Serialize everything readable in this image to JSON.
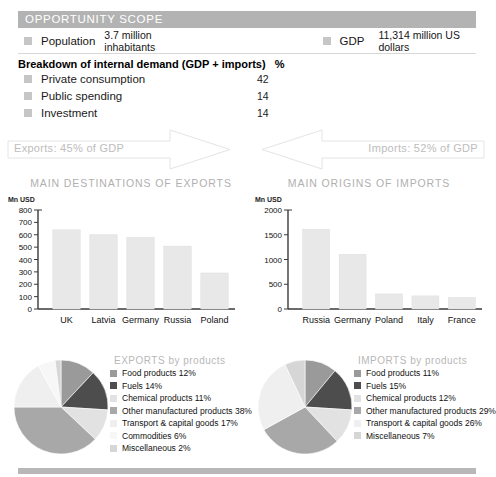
{
  "scope": {
    "header_title": "OPPORTUNITY SCOPE",
    "population_label": "Population",
    "population_value": "3.7 million inhabitants",
    "gdp_label": "GDP",
    "gdp_value": "11,314 million US dollars",
    "breakdown_title": "Breakdown of internal demand (GDP + imports)",
    "breakdown_unit": "%",
    "breakdown_rows": [
      {
        "label": "Private consumption",
        "value": "42"
      },
      {
        "label": "Public spending",
        "value": "14"
      },
      {
        "label": "Investment",
        "value": "14"
      }
    ]
  },
  "flows": {
    "exports_text": "Exports: 45% of GDP",
    "imports_text": "Imports: 52% of GDP",
    "exports_icon": "right-arrow-icon",
    "imports_icon": "left-arrow-icon"
  },
  "colors": {
    "header_gray": "#b3b3b3",
    "swatch_gray": "#c6c6c6",
    "bar_fill": "#e8e8e8",
    "axis": "#3a3a3a",
    "title_gray": "#b0b0b0",
    "slice_food": "#9a9a9a",
    "slice_fuels": "#4d4d4d",
    "slice_chemical": "#e2e2e2",
    "slice_other": "#a8a8a8",
    "slice_transport": "#efefef",
    "slice_commodities": "#f7f7f7",
    "slice_misc": "#d6d6d6"
  },
  "chart_data": [
    {
      "type": "bar",
      "name": "main-destinations-of-exports",
      "title": "MAIN DESTINATIONS OF EXPORTS",
      "ylabel": "Mn USD",
      "xlabel": "",
      "categories": [
        "UK",
        "Latvia",
        "Germany",
        "Russia",
        "Poland"
      ],
      "values": [
        640,
        600,
        578,
        508,
        291
      ],
      "ylim": [
        0,
        800
      ],
      "yticks": [
        0,
        100,
        200,
        300,
        400,
        500,
        600,
        700,
        800
      ],
      "grid": false,
      "legend": "none"
    },
    {
      "type": "bar",
      "name": "main-origins-of-imports",
      "title": "MAIN ORIGINS OF IMPORTS",
      "ylabel": "Mn USD",
      "xlabel": "",
      "categories": [
        "Russia",
        "Germany",
        "Poland",
        "Italy",
        "France"
      ],
      "values": [
        1610,
        1105,
        305,
        265,
        232
      ],
      "ylim": [
        0,
        2000
      ],
      "yticks": [
        0,
        500,
        1000,
        1500,
        2000
      ],
      "grid": false,
      "legend": "none"
    },
    {
      "type": "pie",
      "name": "exports-by-products",
      "title": "EXPORTS by products",
      "legend_position": "right",
      "labels": [
        "Food products",
        "Fuels",
        "Chemical products",
        "Other manufactured products",
        "Transport & capital goods",
        "Commodities",
        "Miscellaneous"
      ],
      "values": [
        12,
        14,
        11,
        38,
        17,
        6,
        2
      ],
      "legend_entries": [
        {
          "label": "Food products 12%",
          "color": "#9a9a9a"
        },
        {
          "label": "Fuels 14%",
          "color": "#4d4d4d"
        },
        {
          "label": "Chemical products 11%",
          "color": "#e2e2e2"
        },
        {
          "label": "Other manufactured products 38%",
          "color": "#a8a8a8"
        },
        {
          "label": "Transport & capital goods 17%",
          "color": "#efefef"
        },
        {
          "label": "Commodities 6%",
          "color": "#f7f7f7"
        },
        {
          "label": "Miscellaneous 2%",
          "color": "#d6d6d6"
        }
      ]
    },
    {
      "type": "pie",
      "name": "imports-by-products",
      "title": "IMPORTS by products",
      "legend_position": "right",
      "labels": [
        "Food products",
        "Fuels",
        "Chemical products",
        "Other manufactured products",
        "Transport & capital goods",
        "Miscellaneous"
      ],
      "values": [
        11,
        15,
        12,
        29,
        26,
        7
      ],
      "legend_entries": [
        {
          "label": "Food products 11%",
          "color": "#9a9a9a"
        },
        {
          "label": "Fuels 15%",
          "color": "#4d4d4d"
        },
        {
          "label": "Chemical products 12%",
          "color": "#e2e2e2"
        },
        {
          "label": "Other manufactured products 29%",
          "color": "#a8a8a8"
        },
        {
          "label": "Transport & capital goods 26%",
          "color": "#efefef"
        },
        {
          "label": "Miscellaneous 7%",
          "color": "#d6d6d6"
        }
      ]
    }
  ]
}
